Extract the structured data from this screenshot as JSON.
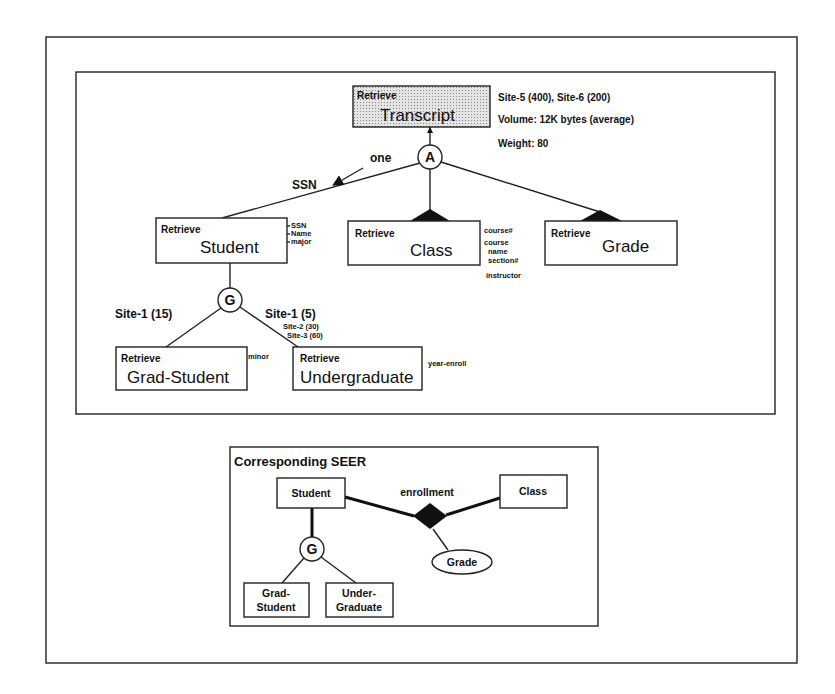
{
  "upper_diagram": {
    "root": {
      "action": "Retrieve",
      "name": "Transcript",
      "info": [
        "Site-5 (400), Site-6 (200)",
        "Volume: 12K bytes (average)",
        "Weight: 80"
      ]
    },
    "aggregation_symbol": "A",
    "aggregation_label": "one",
    "key_label": "SSN",
    "children": [
      {
        "action": "Retrieve",
        "name": "Student",
        "attributes": [
          "SSN",
          "Name",
          "major"
        ]
      },
      {
        "action": "Retrieve",
        "name": "Class",
        "attributes": [
          "course#",
          "course name",
          "section#",
          "instructor"
        ]
      },
      {
        "action": "Retrieve",
        "name": "Grade",
        "attributes": []
      }
    ],
    "generalization_symbol": "G",
    "generalization": {
      "left_label": "Site-1 (15)",
      "right_label": "Site-1 (5)",
      "right_extra": [
        "Site-2 (30)",
        "Site-3 (60)"
      ],
      "children": [
        {
          "action": "Retrieve",
          "name": "Grad-Student",
          "attributes": [
            "minor"
          ]
        },
        {
          "action": "Retrieve",
          "name": "Undergraduate",
          "attributes": [
            "year-enroll"
          ]
        }
      ]
    },
    "attr_lines": {
      "student": [
        "SSN",
        "Name",
        "major"
      ],
      "class": [
        "course#",
        "course",
        "name",
        "section#",
        "instructor"
      ]
    }
  },
  "seer_diagram": {
    "title": "Corresponding SEER",
    "entities": {
      "student": "Student",
      "class": "Class",
      "grad_line1": "Grad-",
      "grad_line2": "Student",
      "under_line1": "Under-",
      "under_line2": "Graduate"
    },
    "relationship": "enrollment",
    "relationship_attribute": "Grade",
    "generalization_symbol": "G"
  }
}
